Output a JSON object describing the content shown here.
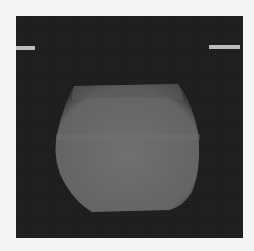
{
  "image": {
    "description": "Grayscale scan of a rounded cylindrical object on a dark background",
    "background_color": "#1e1e1e",
    "object_color": "#6a6a6a"
  },
  "labels": {
    "left": "",
    "right": ""
  }
}
